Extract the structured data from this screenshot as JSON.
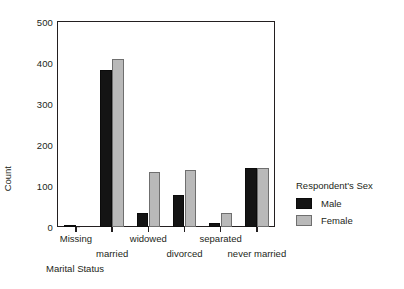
{
  "chart_data": {
    "type": "bar",
    "title": "",
    "xlabel": "Marital Status",
    "ylabel": "Count",
    "categories": [
      "Missing",
      "married",
      "widowed",
      "divorced",
      "separated",
      "never married"
    ],
    "series": [
      {
        "name": "Male",
        "color": "#141414",
        "values": [
          3,
          383,
          32,
          76,
          9,
          142
        ]
      },
      {
        "name": "Female",
        "color": "#b9b9b9",
        "values": [
          0,
          410,
          134,
          137,
          32,
          144
        ]
      }
    ],
    "ylim": [
      0,
      500
    ],
    "ytick_labels": [
      "0",
      "100",
      "200",
      "300",
      "400",
      "500"
    ],
    "ytick_values": [
      0,
      100,
      200,
      300,
      400,
      500
    ],
    "grid": false,
    "legend": {
      "title": "Respondent's Sex",
      "position": "right",
      "entries": [
        {
          "label": "Male",
          "color": "#141414"
        },
        {
          "label": "Female",
          "color": "#b9b9b9"
        }
      ]
    },
    "axis_color": "#231f20"
  }
}
